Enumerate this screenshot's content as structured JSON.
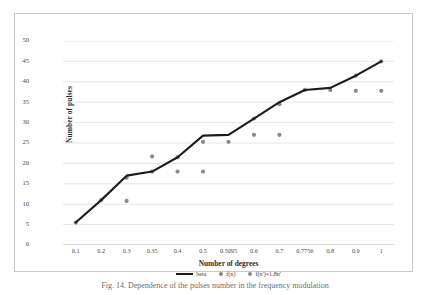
{
  "chart_data": {
    "type": "line",
    "title": "",
    "xlabel": "Number of degrees",
    "ylabel": "Number of pulses",
    "categories": [
      "0.1",
      "0.2",
      "0.3",
      "0.35",
      "0.4",
      "0.5",
      "0.5095",
      "0.6",
      "0.7",
      "0.7756",
      "0.8",
      "0.9",
      "1"
    ],
    "ylim": [
      0,
      50
    ],
    "yticks": [
      0,
      5,
      10,
      15,
      20,
      25,
      30,
      35,
      40,
      45,
      50
    ],
    "grid": true,
    "legend_position": "bottom",
    "series": [
      {
        "name": "beta",
        "kind": "line",
        "color": "#1c1c1c",
        "x": [
          "0.1",
          "0.2",
          "0.3",
          "0.35",
          "0.4",
          "0.5",
          "0.5095",
          "0.6",
          "0.7",
          "0.7756",
          "0.8",
          "0.9",
          "1"
        ],
        "values": [
          5.5,
          11,
          17,
          18,
          21.5,
          26.8,
          27,
          31,
          35,
          38,
          38.5,
          41.5,
          45
        ]
      },
      {
        "name": "f(n)",
        "kind": "scatter",
        "color": "#8a8a8a",
        "x": [
          "0.1",
          "0.2",
          "0.3",
          "0.35",
          "0.4",
          "0.5",
          "0.5095",
          "0.6",
          "0.7",
          "0.7756",
          "0.8",
          "0.9",
          "1"
        ],
        "values": [
          5.5,
          11,
          16.5,
          18,
          21.5,
          25.3,
          25.3,
          31,
          34.5,
          38,
          38,
          41.5,
          45
        ]
      },
      {
        "name": "f(n')=1.8n'",
        "kind": "scatter",
        "color": "#8a8a8a",
        "x": [
          "0.3",
          "0.35",
          "0.4",
          "0.5",
          "0.6",
          "0.7",
          "0.9",
          "1"
        ],
        "values": [
          10.8,
          21.7,
          18,
          18,
          27,
          27,
          37.8,
          37.8
        ]
      }
    ]
  },
  "legend": {
    "items": [
      {
        "label": "beta",
        "marker": "line"
      },
      {
        "label": "f(n)",
        "marker": "dot"
      },
      {
        "label": "f(n')=1.8n'",
        "marker": "dot"
      }
    ]
  },
  "caption": "Fig. 14.  Dependence of the pulses number in the frequency modulation"
}
